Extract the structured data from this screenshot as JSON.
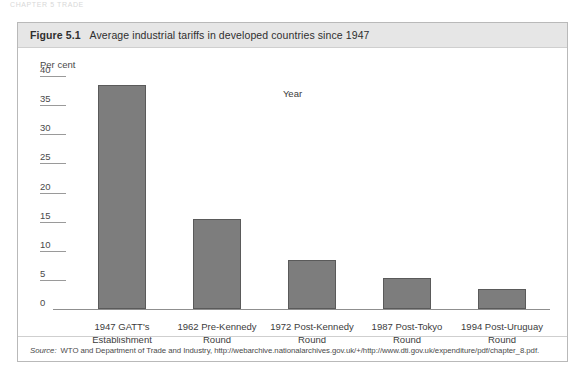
{
  "page_header": "CHAPTER 5  TRADE",
  "figure": {
    "number": "Figure 5.1",
    "title": "Average industrial tariffs in developed countries since 1947",
    "source_label": "Source:",
    "source_text": "WTO and Department of Trade and Industry, http://webarchive.nationalarchives.gov.uk/+/http://www.dti.gov.uk/expenditure/pdf/chapter_8.pdf."
  },
  "chart_data": {
    "type": "bar",
    "title": "Average industrial tariffs in developed countries since 1947",
    "xlabel": "Year",
    "ylabel": "Per cent",
    "ylim": [
      0,
      40
    ],
    "yticks": [
      0,
      5,
      10,
      15,
      20,
      25,
      30,
      35,
      40
    ],
    "ytick_labels": [
      "0",
      "5",
      "10",
      "15",
      "20",
      "25",
      "30",
      "35",
      "40"
    ],
    "grid": false,
    "legend": "none",
    "bar_color": "#7d7d7d",
    "bar_border_color": "#5a5a5a",
    "categories": [
      "1947 GATT's Establishment",
      "1962 Pre-Kennedy Round",
      "1972 Post-Kennedy Round",
      "1987 Post-Tokyo Round",
      "1994 Post-Uruguay Round"
    ],
    "category_lines": [
      [
        "1947 GATT's",
        "Establishment"
      ],
      [
        "1962 Pre-Kennedy",
        "Round"
      ],
      [
        "1972 Post-Kennedy",
        "Round"
      ],
      [
        "1987 Post-Tokyo",
        "Round"
      ],
      [
        "1994 Post-Uruguay",
        "Round"
      ]
    ],
    "values": [
      38.5,
      15.5,
      8.5,
      5.3,
      3.5
    ]
  }
}
